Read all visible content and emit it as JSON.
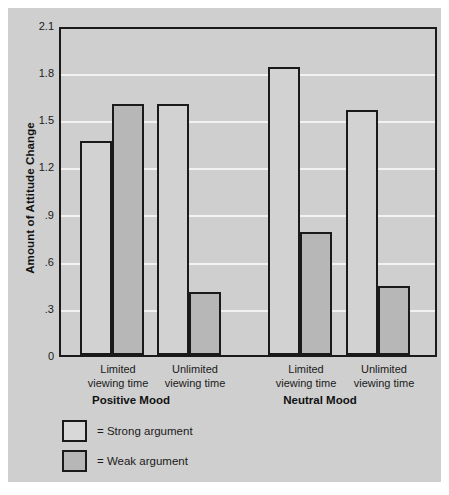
{
  "chart_data": {
    "type": "bar",
    "title": "",
    "xlabel": "",
    "ylabel": "Amount of Attitude Change",
    "ylim": [
      0,
      2.1
    ],
    "yticks": [
      "0",
      ".3",
      ".6",
      ".9",
      "1.2",
      "1.5",
      "1.8",
      "2.1"
    ],
    "ytick_values": [
      0,
      0.3,
      0.6,
      0.9,
      1.2,
      1.5,
      1.8,
      2.1
    ],
    "grid": true,
    "legend_position": "below-left",
    "groups": [
      "Positive Mood",
      "Neutral Mood"
    ],
    "categories": [
      "Limited\nviewing time",
      "Unlimited\nviewing time",
      "Limited\nviewing time",
      "Unlimited\nviewing time"
    ],
    "series": [
      {
        "name": "= Strong argument",
        "values": [
          1.36,
          1.6,
          1.83,
          1.56
        ],
        "color": "#d2d2d2"
      },
      {
        "name": "= Weak argument",
        "values": [
          1.6,
          0.4,
          0.78,
          0.44
        ],
        "color": "#b7b7b7"
      }
    ],
    "bars": [
      {
        "group": "Positive Mood",
        "category": "Limited viewing time",
        "series": "Strong argument",
        "value": 1.36
      },
      {
        "group": "Positive Mood",
        "category": "Limited viewing time",
        "series": "Weak argument",
        "value": 1.6
      },
      {
        "group": "Positive Mood",
        "category": "Unlimited viewing time",
        "series": "Strong argument",
        "value": 1.6
      },
      {
        "group": "Positive Mood",
        "category": "Unlimited viewing time",
        "series": "Weak argument",
        "value": 0.4
      },
      {
        "group": "Neutral Mood",
        "category": "Limited viewing time",
        "series": "Strong argument",
        "value": 1.83
      },
      {
        "group": "Neutral Mood",
        "category": "Limited viewing time",
        "series": "Weak argument",
        "value": 0.78
      },
      {
        "group": "Neutral Mood",
        "category": "Unlimited viewing time",
        "series": "Strong argument",
        "value": 1.56
      },
      {
        "group": "Neutral Mood",
        "category": "Unlimited viewing time",
        "series": "Weak argument",
        "value": 0.44
      }
    ]
  },
  "axis": {
    "y_title": "Amount of Attitude Change",
    "y_labels": [
      "2.1",
      "1.8",
      "1.5",
      "1.2",
      ".9",
      ".6",
      ".3",
      "0"
    ]
  },
  "x_categories": [
    {
      "line1": "Limited",
      "line2": "viewing time"
    },
    {
      "line1": "Unlimited",
      "line2": "viewing time"
    },
    {
      "line1": "Limited",
      "line2": "viewing time"
    },
    {
      "line1": "Unlimited",
      "line2": "viewing time"
    }
  ],
  "x_groups": [
    {
      "label": "Positive Mood"
    },
    {
      "label": "Neutral Mood"
    }
  ],
  "legend": {
    "items": [
      {
        "label": "= Strong argument",
        "swatch": "strong"
      },
      {
        "label": "= Weak argument",
        "swatch": "weak"
      }
    ]
  },
  "colors": {
    "card_background": "#cfcfcf",
    "plot_border": "#1a1a1a",
    "gridline": "#f2f2f2",
    "strong_bar": "#d2d2d2",
    "weak_bar": "#b7b7b7",
    "text": "#1a1a1a"
  }
}
